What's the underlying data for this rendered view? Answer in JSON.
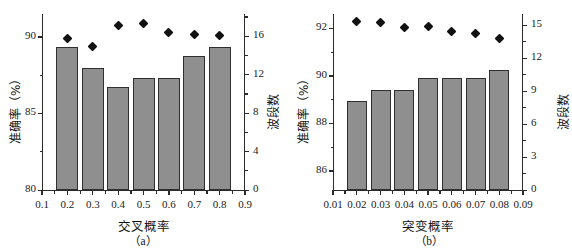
{
  "figure": {
    "panels": [
      "a",
      "b"
    ]
  },
  "panel_a": {
    "caption": "（a）",
    "xlabel": "交叉概率",
    "ylabel_left": "准确率（%）",
    "ylabel_right": "波段数",
    "x_ticks": [
      "0.1",
      "0.2",
      "0.3",
      "0.4",
      "0.5",
      "0.6",
      "0.7",
      "0.8",
      "0.9"
    ],
    "y_ticks_left": [
      "90",
      "85",
      "80"
    ],
    "y_ticks_right": [
      "16",
      "12",
      "8",
      "4",
      "0"
    ]
  },
  "panel_b": {
    "caption": "（b）",
    "xlabel": "突变概率",
    "ylabel_left": "准确率（%）",
    "ylabel_right": "波段数",
    "x_ticks": [
      "0.01",
      "0.02",
      "0.03",
      "0.04",
      "0.05",
      "0.06",
      "0.07",
      "0.08",
      "0.09"
    ],
    "y_ticks_left": [
      "92",
      "90",
      "88",
      "86"
    ],
    "y_ticks_right": [
      "15",
      "12",
      "9",
      "6",
      "3",
      "0"
    ]
  },
  "style": {
    "bar_color": "#8f8f8f",
    "bar_edge_color": "#2f2f2f",
    "marker_color": "#111111",
    "axis_color": "#2b2b2b"
  },
  "chart_data": [
    {
      "type": "bar",
      "panel": "a",
      "title": "",
      "xlabel": "交叉概率",
      "ylabel": "准确率（%）",
      "ylabel_secondary": "波段数",
      "categories": [
        "0.2",
        "0.3",
        "0.4",
        "0.5",
        "0.6",
        "0.7",
        "0.8"
      ],
      "xlim": [
        0.1,
        0.9
      ],
      "ylim": [
        80,
        91.5
      ],
      "ylim_secondary": [
        0,
        18.3
      ],
      "grid": false,
      "legend": "none",
      "series": [
        {
          "name": "准确率（%）",
          "type": "bar",
          "axis": "left",
          "values": [
            89.35,
            87.95,
            86.7,
            87.3,
            87.3,
            88.75,
            89.35
          ]
        },
        {
          "name": "波段数",
          "type": "scatter",
          "axis": "right",
          "marker": "diamond",
          "values": [
            15.8,
            14.9,
            17.1,
            17.3,
            16.4,
            16.2,
            16.1
          ]
        }
      ]
    },
    {
      "type": "bar",
      "panel": "b",
      "title": "",
      "xlabel": "突变概率",
      "ylabel": "准确率（%）",
      "ylabel_secondary": "波段数",
      "categories": [
        "0.02",
        "0.03",
        "0.04",
        "0.05",
        "0.06",
        "0.07",
        "0.08"
      ],
      "xlim": [
        0.01,
        0.09
      ],
      "ylim": [
        85.2,
        92.6
      ],
      "ylim_secondary": [
        0,
        16.0
      ],
      "grid": false,
      "legend": "none",
      "series": [
        {
          "name": "准确率（%）",
          "type": "bar",
          "axis": "left",
          "values": [
            88.95,
            89.4,
            89.4,
            89.9,
            89.9,
            89.9,
            90.25
          ]
        },
        {
          "name": "波段数",
          "type": "scatter",
          "axis": "right",
          "marker": "diamond",
          "values": [
            15.3,
            15.2,
            14.8,
            14.9,
            14.4,
            14.2,
            13.8
          ]
        }
      ]
    }
  ]
}
